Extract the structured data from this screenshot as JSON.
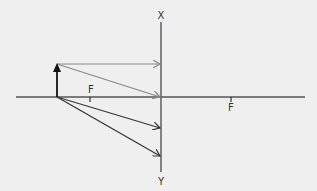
{
  "diagram": {
    "type": "ray-diagram",
    "colors": {
      "background": "#efefef",
      "axis": "#555555",
      "lens": "#666666",
      "object": "#111111",
      "ray_gray": "#888888",
      "ray_dark": "#333333",
      "label": "#333333"
    },
    "labels": {
      "lens_top": "X",
      "lens_bottom": "Y",
      "focus_left": "F",
      "focus_right": "F"
    },
    "geometry": {
      "axis": {
        "x1": 16,
        "y1": 97,
        "x2": 305,
        "y2": 97
      },
      "lens": {
        "x1": 161,
        "y1": 22,
        "x2": 161,
        "y2": 172
      },
      "object": {
        "x1": 57,
        "y1": 97,
        "x2": 57,
        "y2": 64
      },
      "focus_left_tick": {
        "x": 90,
        "y1": 97,
        "y2": 102
      },
      "focus_right_tick": {
        "x": 231,
        "y1": 97,
        "y2": 102
      },
      "rays": [
        {
          "name": "parallel-ray",
          "x1": 57,
          "y1": 64,
          "x2": 161,
          "y2": 64,
          "style": "gray"
        },
        {
          "name": "center-ray",
          "x1": 57,
          "y1": 64,
          "x2": 161,
          "y2": 97,
          "style": "gray"
        },
        {
          "name": "lower-ray-1",
          "x1": 57,
          "y1": 97,
          "x2": 161,
          "y2": 128,
          "style": "dark"
        },
        {
          "name": "lower-ray-2",
          "x1": 57,
          "y1": 97,
          "x2": 161,
          "y2": 156,
          "style": "dark"
        }
      ]
    }
  }
}
